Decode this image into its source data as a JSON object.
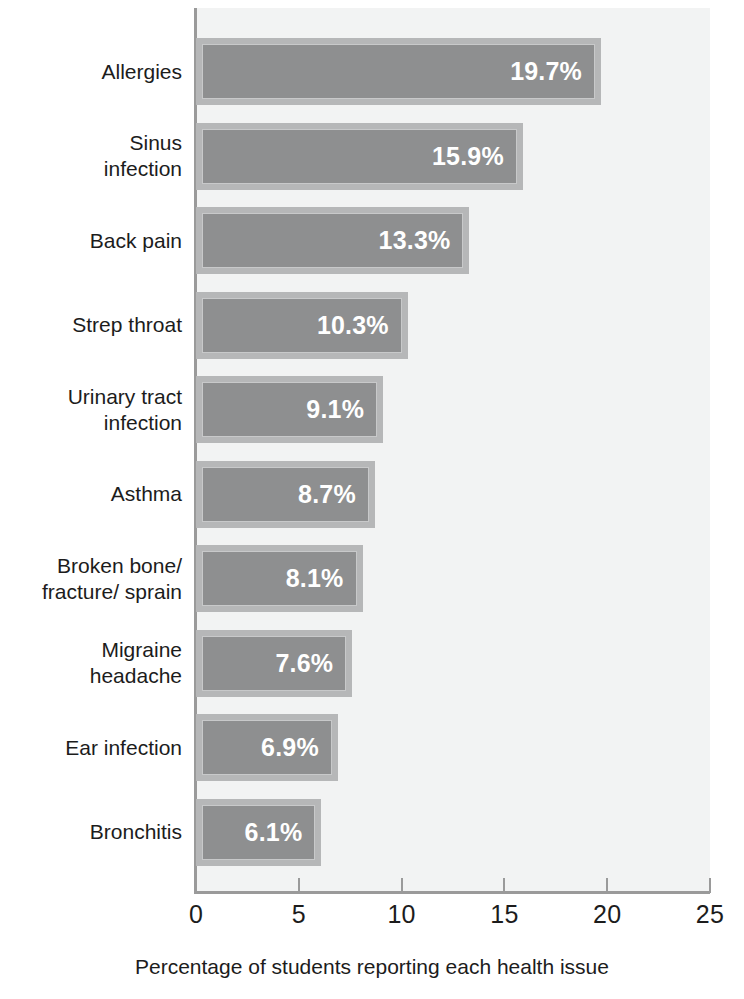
{
  "chart_data": {
    "type": "bar",
    "orientation": "horizontal",
    "title": "",
    "xlabel": "Percentage of students reporting each health issue",
    "ylabel": "",
    "xlim": [
      0,
      25
    ],
    "grid": false,
    "legend": null,
    "categories": [
      "Allergies",
      "Sinus infection",
      "Back pain",
      "Strep throat",
      "Urinary tract infection",
      "Asthma",
      "Broken bone/ fracture/ sprain",
      "Migraine headache",
      "Ear infection",
      "Bronchitis"
    ],
    "values": [
      19.7,
      15.9,
      13.3,
      10.3,
      9.1,
      8.7,
      8.1,
      7.6,
      6.9,
      6.1
    ],
    "value_labels": [
      "19.7%",
      "15.9%",
      "13.3%",
      "10.3%",
      "9.1%",
      "8.7%",
      "8.1%",
      "7.6%",
      "6.9%",
      "6.1%"
    ],
    "xticks": [
      0,
      5,
      10,
      15,
      20,
      25
    ],
    "xtick_labels": [
      "0",
      "5",
      "10",
      "15",
      "20",
      "25"
    ],
    "colors": {
      "bar_fill": "#8e8f90",
      "bar_border": "#b6b7b8",
      "bar_inner_highlight": "#c8c9ca",
      "plot_background": "#f2f3f3",
      "axis_line": "#9a9a9a",
      "text": "#1c1c1c",
      "value_text": "#ffffff"
    }
  },
  "rows": [
    {
      "label_line1": "Allergies",
      "label_line2": "",
      "value": "19.7%"
    },
    {
      "label_line1": "Sinus",
      "label_line2": "infection",
      "value": "15.9%"
    },
    {
      "label_line1": "Back pain",
      "label_line2": "",
      "value": "13.3%"
    },
    {
      "label_line1": "Strep throat",
      "label_line2": "",
      "value": "10.3%"
    },
    {
      "label_line1": "Urinary tract",
      "label_line2": "infection",
      "value": "9.1%"
    },
    {
      "label_line1": "Asthma",
      "label_line2": "",
      "value": "8.7%"
    },
    {
      "label_line1": "Broken bone/",
      "label_line2": "fracture/ sprain",
      "value": "8.1%"
    },
    {
      "label_line1": "Migraine",
      "label_line2": "headache",
      "value": "7.6%"
    },
    {
      "label_line1": "Ear infection",
      "label_line2": "",
      "value": "6.9%"
    },
    {
      "label_line1": "Bronchitis",
      "label_line2": "",
      "value": "6.1%"
    }
  ]
}
